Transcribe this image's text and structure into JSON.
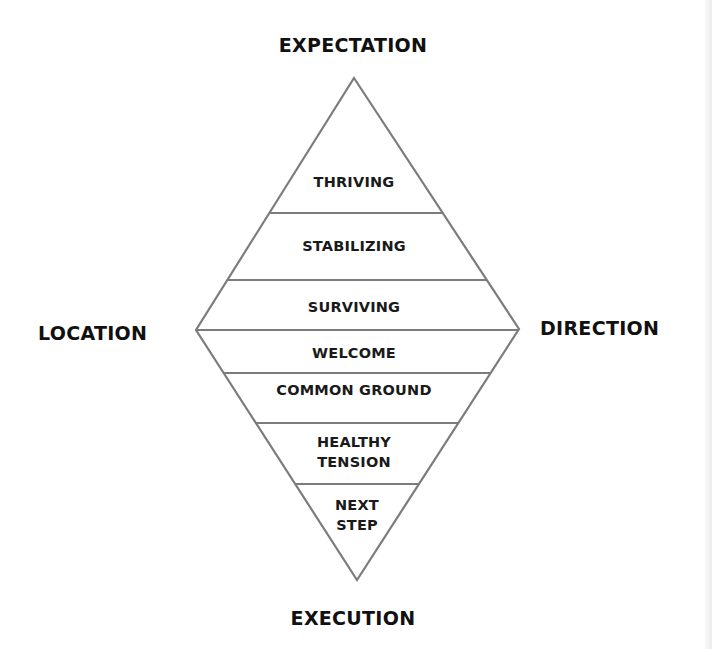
{
  "diagram": {
    "type": "diamond-framework",
    "outer_labels": {
      "top": "EXPECTATION",
      "left": "LOCATION",
      "right": "DIRECTION",
      "bottom": "EXECUTION"
    },
    "upper_triangle_bands": [
      {
        "label": "THRIVING"
      },
      {
        "label": "STABILIZING"
      },
      {
        "label": "SURVIVING"
      }
    ],
    "lower_triangle_bands": [
      {
        "label": "WELCOME"
      },
      {
        "label": "COMMON GROUND"
      },
      {
        "label": "HEALTHY",
        "label2": "TENSION"
      },
      {
        "label": "NEXT",
        "label2": "STEP"
      }
    ],
    "colors": {
      "outline": "#7a7a7a",
      "text": "#111111",
      "background": "#ffffff"
    }
  }
}
